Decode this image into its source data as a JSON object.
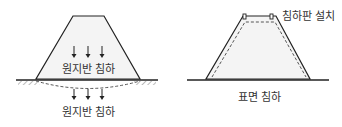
{
  "left_panel": {
    "inner_label": "원지반 침하",
    "bottom_label": "원지반 침하"
  },
  "right_panel": {
    "plate_label": "침하판 설치",
    "bottom_label": "표면 침하"
  },
  "colors": {
    "line": "#222222",
    "fill": "#f4f4f4",
    "text": "#333333"
  }
}
